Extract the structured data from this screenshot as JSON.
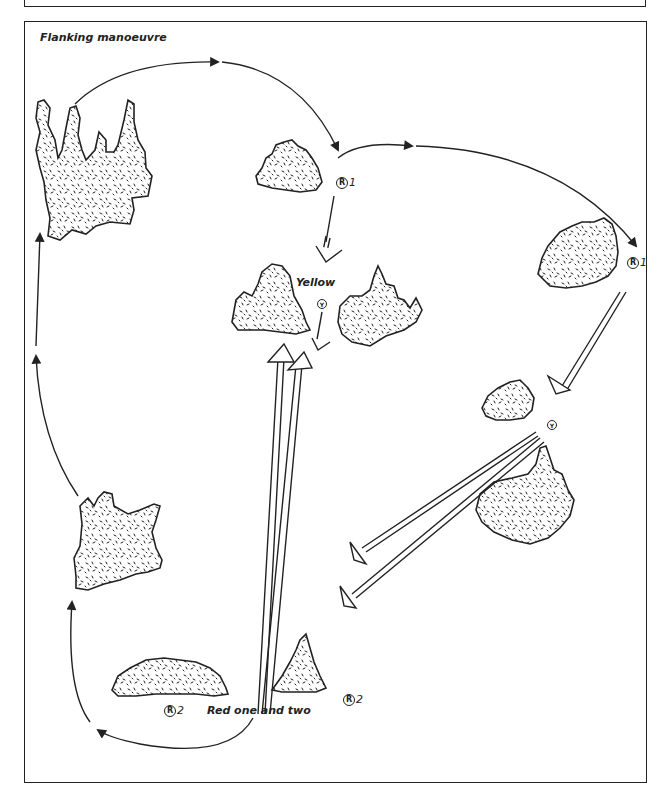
{
  "header": {
    "section_title": "THE GAME"
  },
  "figure": {
    "title": "Flanking manoeuvre",
    "labels": {
      "yellow": "Yellow",
      "red_group": "Red one and two"
    },
    "markers": [
      {
        "id": "red-1-start",
        "symbol": "R",
        "number": "1"
      },
      {
        "id": "red-1-end",
        "symbol": "R",
        "number": "1"
      },
      {
        "id": "yellow-center",
        "symbol": "Y",
        "number": ""
      },
      {
        "id": "yellow-right",
        "symbol": "Y",
        "number": ""
      },
      {
        "id": "red-2-left",
        "symbol": "R",
        "number": "2"
      },
      {
        "id": "red-2-right",
        "symbol": "R",
        "number": "2"
      }
    ]
  },
  "colors": {
    "ink": "#222222",
    "paper": "#ffffff"
  }
}
